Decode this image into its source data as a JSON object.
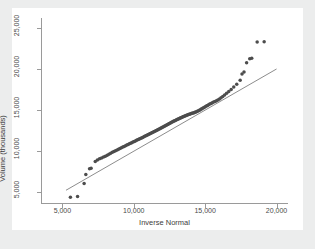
{
  "chart_data": {
    "type": "scatter",
    "title": "",
    "xlabel": "Inverse Normal",
    "ylabel": "Volume (thousands)",
    "xlim": [
      3500,
      20800
    ],
    "ylim": [
      3700,
      26200
    ],
    "xticks": [
      5000,
      10000,
      15000,
      20000
    ],
    "xtick_labels": [
      "5,000",
      "10,000",
      "15,000",
      "20,000"
    ],
    "yticks": [
      5000,
      10000,
      15000,
      20000,
      25000
    ],
    "ytick_labels": [
      "5,000",
      "10,000",
      "15,000",
      "20,000",
      "25,000"
    ],
    "grid": false,
    "legend": null,
    "marker_color": "#4c4c4c",
    "line_color": "#6f6f6f",
    "background": "#ffffff",
    "canvas_background": "#eceded",
    "reference_line": {
      "name": "identity-line",
      "x": [
        5250,
        20000
      ],
      "y": [
        5250,
        20000
      ]
    },
    "series": [
      {
        "name": "Volume quantiles",
        "points": [
          [
            5560,
            4390
          ],
          [
            6060,
            4500
          ],
          [
            6520,
            6080
          ],
          [
            6640,
            7170
          ],
          [
            6900,
            7870
          ],
          [
            7010,
            7930
          ],
          [
            7300,
            8760
          ],
          [
            7450,
            8930
          ],
          [
            7600,
            9080
          ],
          [
            7740,
            9180
          ],
          [
            7880,
            9290
          ],
          [
            8010,
            9390
          ],
          [
            8140,
            9500
          ],
          [
            8260,
            9620
          ],
          [
            8380,
            9760
          ],
          [
            8500,
            9870
          ],
          [
            8610,
            9960
          ],
          [
            8720,
            10060
          ],
          [
            8830,
            10160
          ],
          [
            8930,
            10250
          ],
          [
            9030,
            10330
          ],
          [
            9130,
            10420
          ],
          [
            9230,
            10500
          ],
          [
            9320,
            10580
          ],
          [
            9420,
            10670
          ],
          [
            9510,
            10740
          ],
          [
            9600,
            10820
          ],
          [
            9690,
            10900
          ],
          [
            9770,
            10970
          ],
          [
            9860,
            11040
          ],
          [
            9940,
            11110
          ],
          [
            10030,
            11180
          ],
          [
            10110,
            11250
          ],
          [
            10190,
            11320
          ],
          [
            10270,
            11390
          ],
          [
            10350,
            11450
          ],
          [
            10420,
            11520
          ],
          [
            10500,
            11580
          ],
          [
            10580,
            11650
          ],
          [
            10650,
            11710
          ],
          [
            10730,
            11780
          ],
          [
            10800,
            11840
          ],
          [
            10880,
            11900
          ],
          [
            10950,
            11970
          ],
          [
            11020,
            12030
          ],
          [
            11090,
            12090
          ],
          [
            11160,
            12150
          ],
          [
            11230,
            12210
          ],
          [
            11300,
            12280
          ],
          [
            11370,
            12340
          ],
          [
            11440,
            12400
          ],
          [
            11510,
            12460
          ],
          [
            11580,
            12520
          ],
          [
            11650,
            12580
          ],
          [
            11710,
            12640
          ],
          [
            11780,
            12700
          ],
          [
            11850,
            12770
          ],
          [
            11910,
            12830
          ],
          [
            11980,
            12890
          ],
          [
            12040,
            12950
          ],
          [
            12110,
            13010
          ],
          [
            12170,
            13070
          ],
          [
            12240,
            13130
          ],
          [
            12300,
            13190
          ],
          [
            12370,
            13250
          ],
          [
            12430,
            13310
          ],
          [
            12490,
            13370
          ],
          [
            12560,
            13430
          ],
          [
            12620,
            13490
          ],
          [
            12680,
            13550
          ],
          [
            12750,
            13600
          ],
          [
            12810,
            13660
          ],
          [
            12870,
            13710
          ],
          [
            12940,
            13770
          ],
          [
            13000,
            13820
          ],
          [
            13060,
            13880
          ],
          [
            13120,
            13930
          ],
          [
            13190,
            13980
          ],
          [
            13250,
            14030
          ],
          [
            13310,
            14080
          ],
          [
            13380,
            14130
          ],
          [
            13440,
            14180
          ],
          [
            13500,
            14230
          ],
          [
            13570,
            14280
          ],
          [
            13630,
            14320
          ],
          [
            13690,
            14370
          ],
          [
            13760,
            14410
          ],
          [
            13820,
            14450
          ],
          [
            13890,
            14490
          ],
          [
            13950,
            14530
          ],
          [
            14020,
            14570
          ],
          [
            14080,
            14610
          ],
          [
            14150,
            14650
          ],
          [
            14220,
            14690
          ],
          [
            14280,
            14730
          ],
          [
            14350,
            14780
          ],
          [
            14420,
            14830
          ],
          [
            14490,
            14890
          ],
          [
            14560,
            14950
          ],
          [
            14630,
            15020
          ],
          [
            14700,
            15090
          ],
          [
            14770,
            15170
          ],
          [
            14850,
            15250
          ],
          [
            14920,
            15330
          ],
          [
            15000,
            15410
          ],
          [
            15080,
            15490
          ],
          [
            15160,
            15570
          ],
          [
            15240,
            15650
          ],
          [
            15320,
            15730
          ],
          [
            15410,
            15810
          ],
          [
            15500,
            15890
          ],
          [
            15590,
            15970
          ],
          [
            15690,
            16050
          ],
          [
            15790,
            16140
          ],
          [
            15890,
            16240
          ],
          [
            16000,
            16360
          ],
          [
            16110,
            16500
          ],
          [
            16230,
            16660
          ],
          [
            16360,
            16840
          ],
          [
            16500,
            17040
          ],
          [
            16650,
            17260
          ],
          [
            16820,
            17510
          ],
          [
            17000,
            17800
          ],
          [
            17210,
            18150
          ],
          [
            17450,
            18620
          ],
          [
            17580,
            19390
          ],
          [
            17720,
            19630
          ],
          [
            17900,
            20770
          ],
          [
            18120,
            21250
          ],
          [
            18260,
            21300
          ],
          [
            18640,
            23280
          ],
          [
            19130,
            23320
          ]
        ]
      }
    ]
  }
}
